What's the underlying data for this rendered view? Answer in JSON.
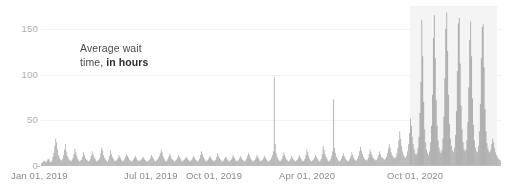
{
  "chart_data": {
    "type": "bar",
    "title": "",
    "subtitle": "",
    "xlabel": "",
    "ylabel": "Average wait time, in hours",
    "annotation": {
      "line1": "Average wait",
      "line2_plain": "time, ",
      "line2_strong": "in hours"
    },
    "ylim": [
      0,
      175
    ],
    "y_ticks": [
      0,
      50,
      100,
      150
    ],
    "y_tick_labels": [
      "0",
      "50",
      "100",
      "150"
    ],
    "grid": true,
    "legend": null,
    "bar_color": "#8d8d8d",
    "highlight_color": "#f4f4f4",
    "axis_color": "#bdbdbd",
    "x_range": [
      "Jan 01, 2019",
      "Dec 31, 2020"
    ],
    "x_tick_labels": [
      "Jan 01, 2019",
      "Jul 01, 2019",
      "Oct 01, 2019",
      "Apr 01, 2020",
      "Oct 01, 2020"
    ],
    "x_tick_positions_px": [
      11,
      124,
      186,
      279,
      387
    ],
    "highlight_region": {
      "label": "Oct 2020 - Dec 2020 surge",
      "start_px": 410,
      "end_px": 497
    },
    "series": [
      {
        "name": "Average wait time",
        "unit": "hours",
        "n_points": 460,
        "baseline": 4,
        "values": [
          3,
          4,
          5,
          6,
          5,
          4,
          6,
          8,
          7,
          5,
          4,
          6,
          10,
          14,
          22,
          30,
          26,
          18,
          12,
          9,
          7,
          6,
          8,
          12,
          18,
          24,
          16,
          11,
          9,
          7,
          6,
          5,
          7,
          9,
          13,
          19,
          15,
          11,
          8,
          6,
          5,
          6,
          7,
          10,
          15,
          12,
          9,
          7,
          6,
          5,
          6,
          8,
          11,
          16,
          13,
          10,
          8,
          6,
          5,
          6,
          7,
          9,
          14,
          20,
          17,
          12,
          9,
          7,
          6,
          5,
          7,
          11,
          17,
          13,
          10,
          8,
          6,
          5,
          6,
          7,
          9,
          12,
          10,
          8,
          6,
          5,
          6,
          8,
          10,
          13,
          11,
          9,
          7,
          6,
          5,
          6,
          7,
          9,
          11,
          9,
          7,
          6,
          5,
          6,
          7,
          8,
          10,
          9,
          7,
          6,
          5,
          5,
          6,
          7,
          9,
          12,
          10,
          8,
          6,
          5,
          6,
          7,
          9,
          11,
          14,
          18,
          15,
          11,
          8,
          6,
          5,
          6,
          8,
          10,
          13,
          11,
          8,
          7,
          6,
          5,
          6,
          7,
          9,
          12,
          10,
          8,
          6,
          5,
          6,
          7,
          8,
          10,
          9,
          7,
          6,
          5,
          6,
          7,
          9,
          11,
          9,
          7,
          6,
          5,
          6,
          8,
          12,
          16,
          13,
          10,
          8,
          6,
          5,
          6,
          7,
          9,
          11,
          9,
          7,
          6,
          5,
          6,
          7,
          10,
          14,
          11,
          9,
          7,
          6,
          5,
          6,
          8,
          10,
          9,
          7,
          6,
          5,
          6,
          7,
          9,
          12,
          10,
          8,
          6,
          5,
          6,
          7,
          9,
          11,
          9,
          7,
          6,
          5,
          6,
          8,
          11,
          14,
          12,
          9,
          7,
          6,
          5,
          6,
          7,
          9,
          12,
          10,
          8,
          6,
          5,
          6,
          7,
          9,
          11,
          9,
          7,
          6,
          5,
          6,
          7,
          9,
          12,
          16,
          97,
          24,
          14,
          10,
          8,
          6,
          5,
          6,
          8,
          11,
          15,
          12,
          9,
          7,
          6,
          5,
          6,
          8,
          11,
          9,
          7,
          6,
          5,
          6,
          7,
          9,
          12,
          10,
          8,
          6,
          5,
          6,
          8,
          12,
          18,
          15,
          11,
          8,
          6,
          5,
          6,
          7,
          9,
          12,
          10,
          8,
          6,
          5,
          6,
          8,
          13,
          22,
          18,
          13,
          10,
          8,
          6,
          5,
          6,
          8,
          11,
          16,
          73,
          20,
          14,
          10,
          8,
          6,
          5,
          6,
          8,
          11,
          14,
          11,
          9,
          7,
          6,
          5,
          6,
          8,
          11,
          15,
          12,
          9,
          7,
          6,
          6,
          8,
          11,
          16,
          21,
          17,
          13,
          10,
          8,
          7,
          6,
          7,
          9,
          13,
          18,
          15,
          12,
          9,
          8,
          7,
          6,
          7,
          9,
          12,
          16,
          13,
          10,
          9,
          8,
          7,
          8,
          10,
          14,
          19,
          24,
          20,
          15,
          12,
          10,
          9,
          8,
          10,
          14,
          20,
          28,
          38,
          30,
          22,
          16,
          12,
          10,
          9,
          11,
          16,
          24,
          36,
          52,
          44,
          32,
          24,
          18,
          14,
          12,
          14,
          20,
          32,
          58,
          92,
          160,
          120,
          70,
          40,
          26,
          18,
          14,
          12,
          16,
          26,
          44,
          78,
          140,
          165,
          118,
          72,
          44,
          28,
          20,
          16,
          14,
          18,
          30,
          54,
          96,
          150,
          168,
          126,
          78,
          46,
          30,
          22,
          17,
          15,
          20,
          34,
          60,
          104,
          156,
          162,
          112,
          66,
          40,
          26,
          19,
          16,
          18,
          28,
          48,
          86,
          138,
          158,
          120,
          74,
          45,
          28,
          20,
          16,
          15,
          22,
          38,
          68,
          118,
          152,
          155,
          108,
          62,
          38,
          25,
          19,
          16,
          15,
          18,
          24,
          30,
          26,
          20,
          15,
          12,
          10,
          8,
          7,
          6
        ]
      }
    ]
  }
}
